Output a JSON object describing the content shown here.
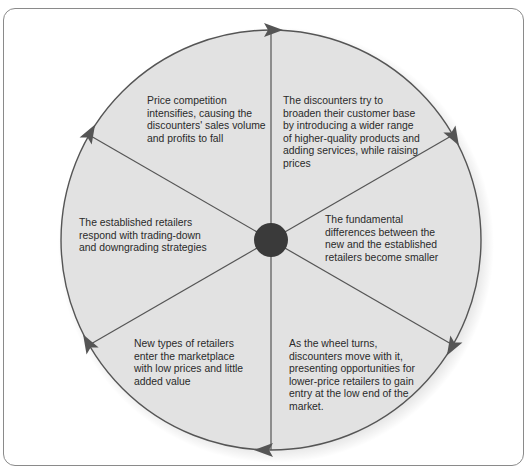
{
  "diagram": {
    "center": {
      "x": 271,
      "y": 240,
      "radius": 210,
      "hub_radius": 16
    },
    "colors": {
      "fill": "#e2e2e2",
      "stroke": "#555555",
      "hub": "#3a3a3a",
      "text": "#2a2a2a",
      "frame": "#8a8a8a"
    },
    "segments": [
      {
        "id": "new-retailers",
        "text": "New types of retailers enter the marketplace with low prices and little added value"
      },
      {
        "id": "discounters-broaden",
        "text": "The discounters try to broaden their customer base by introducing a wider range of higher-quality products and adding services, while raising prices"
      },
      {
        "id": "differences-smaller",
        "text": "The fundamental differences between the new and the established retailers become smaller"
      },
      {
        "id": "wheel-turns",
        "text": "As the wheel turns, discounters move with it, presenting opportunities for lower-price retailers to gain entry at the low end of the market."
      },
      {
        "id": "established-respond",
        "text": "The established retailers respond with trading-down and downgrading strategies"
      },
      {
        "id": "price-competition",
        "text": "Price competition intensifies, causing the discounters' sales volume and profits to fall"
      }
    ],
    "flow_direction": "clockwise"
  }
}
